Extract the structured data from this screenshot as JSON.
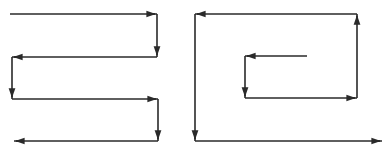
{
  "diagram": {
    "stroke_color": "#2a2a2a",
    "background": "#ffffff",
    "panels": [
      {
        "name": "boustrophedon-zigzag",
        "segments": [
          {
            "from": [
              10,
              14
            ],
            "to": [
              157,
              14
            ],
            "direction": "right"
          },
          {
            "from": [
              157,
              14
            ],
            "to": [
              157,
              57
            ],
            "direction": "down"
          },
          {
            "from": [
              157,
              57
            ],
            "to": [
              12,
              57
            ],
            "direction": "left"
          },
          {
            "from": [
              12,
              57
            ],
            "to": [
              12,
              99
            ],
            "direction": "down"
          },
          {
            "from": [
              12,
              99
            ],
            "to": [
              158,
              99
            ],
            "direction": "right"
          },
          {
            "from": [
              158,
              99
            ],
            "to": [
              158,
              141
            ],
            "direction": "down"
          },
          {
            "from": [
              158,
              141
            ],
            "to": [
              14,
              141
            ],
            "direction": "left"
          }
        ]
      },
      {
        "name": "outward-spiral",
        "segments": [
          {
            "from": [
              307,
              56
            ],
            "to": [
              245,
              56
            ],
            "direction": "left"
          },
          {
            "from": [
              245,
              56
            ],
            "to": [
              245,
              98
            ],
            "direction": "down"
          },
          {
            "from": [
              245,
              98
            ],
            "to": [
              357,
              98
            ],
            "direction": "right"
          },
          {
            "from": [
              357,
              98
            ],
            "to": [
              357,
              14
            ],
            "direction": "up"
          },
          {
            "from": [
              357,
              14
            ],
            "to": [
              195,
              14
            ],
            "direction": "left"
          },
          {
            "from": [
              195,
              14
            ],
            "to": [
              195,
              141
            ],
            "direction": "down"
          },
          {
            "from": [
              195,
              141
            ],
            "to": [
              382,
              141
            ],
            "direction": "right"
          }
        ]
      }
    ]
  }
}
